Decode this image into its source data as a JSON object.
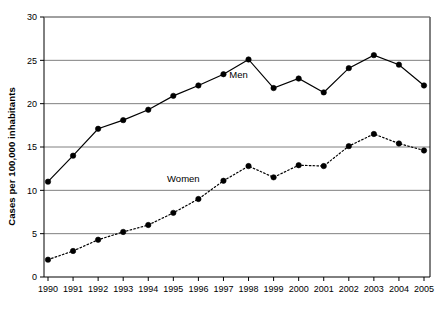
{
  "chart_data": {
    "type": "line",
    "title": "",
    "xlabel": "",
    "ylabel": "Cases per 100,000 inhabitants",
    "categories": [
      "1990",
      "1991",
      "1992",
      "1993",
      "1994",
      "1995",
      "1996",
      "1997",
      "1998",
      "1999",
      "2000",
      "2001",
      "2002",
      "2003",
      "2004",
      "2005"
    ],
    "ylim": [
      0,
      30
    ],
    "ytick_labels": [
      "0",
      "5",
      "10",
      "15",
      "20",
      "25",
      "30"
    ],
    "ytick_values": [
      0,
      5,
      10,
      15,
      20,
      25,
      30
    ],
    "grid": "horizontal",
    "legend_position": "inline-annotation",
    "series": [
      {
        "name": "Men",
        "line_style": "solid",
        "color": "#000000",
        "marker": "filled-circle",
        "label_x": "1997.6",
        "label_y": "23.0",
        "values": [
          11.0,
          14.0,
          17.1,
          18.1,
          19.3,
          20.9,
          22.1,
          23.4,
          25.1,
          21.8,
          22.9,
          21.3,
          24.1,
          25.6,
          24.5,
          22.1
        ]
      },
      {
        "name": "Women",
        "line_style": "dotted",
        "color": "#000000",
        "marker": "filled-circle",
        "label_x": "1995.4",
        "label_y": "11.0",
        "values": [
          2.0,
          3.0,
          4.3,
          5.2,
          6.0,
          7.4,
          9.0,
          11.1,
          12.8,
          11.5,
          12.9,
          12.8,
          15.1,
          16.5,
          15.4,
          14.6
        ]
      }
    ]
  },
  "annotations": {
    "men_label": "Men",
    "women_label": "Women"
  }
}
